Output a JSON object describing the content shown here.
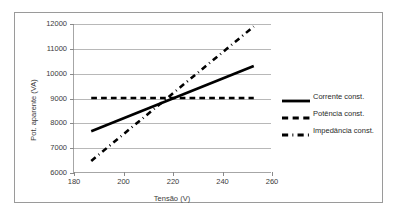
{
  "chart_data": {
    "type": "line",
    "title": "",
    "xlabel": "Tensão (V)",
    "ylabel": "Pot. aparente (VA)",
    "xlim": [
      180,
      260
    ],
    "ylim": [
      6000,
      12000
    ],
    "xticks": [
      180,
      200,
      220,
      240,
      260
    ],
    "yticks": [
      6000,
      7000,
      8000,
      9000,
      10000,
      11000,
      12000
    ],
    "grid": true,
    "legend_position": "right",
    "series": [
      {
        "name": "Corrente const.",
        "style": "solid",
        "x": [
          187,
          253
        ],
        "values": [
          7650,
          10300
        ]
      },
      {
        "name": "Potência const.",
        "style": "dashed",
        "x": [
          187,
          253
        ],
        "values": [
          9000,
          9000
        ]
      },
      {
        "name": "Impedância const.",
        "style": "dashdot",
        "x": [
          187,
          253
        ],
        "values": [
          6450,
          11900
        ]
      }
    ]
  },
  "axes": {
    "y": {
      "title": "Pot. aparente (VA)",
      "tick_labels": [
        "12000",
        "11000",
        "10000",
        "9000",
        "8000",
        "7000",
        "6000"
      ]
    },
    "x": {
      "title": "Tensão (V)",
      "tick_labels": [
        "180",
        "200",
        "220",
        "240",
        "260"
      ]
    }
  },
  "legend": {
    "items": [
      {
        "label": "Corrente const.",
        "style": "solid"
      },
      {
        "label": "Potência const.",
        "style": "dashed"
      },
      {
        "label": "Impedância const.",
        "style": "dashdot"
      }
    ]
  },
  "colors": {
    "series_line": "#000000",
    "gridline": "#b8b8b8",
    "axis": "#a6a6a6",
    "frame": "#9a9a9a",
    "text": "#3a3a3a",
    "background": "#ffffff"
  }
}
